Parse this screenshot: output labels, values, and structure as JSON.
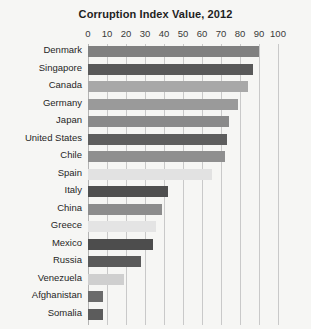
{
  "chart_data": {
    "type": "bar",
    "orientation": "horizontal",
    "title": "Corruption Index Value, 2012",
    "xlabel": "",
    "ylabel": "",
    "xlim": [
      0,
      100
    ],
    "xticks": [
      0,
      10,
      20,
      30,
      40,
      50,
      60,
      70,
      80,
      90,
      100
    ],
    "grid": true,
    "legend": false,
    "categories": [
      "Denmark",
      "Singapore",
      "Canada",
      "Germany",
      "Japan",
      "United States",
      "Chile",
      "Spain",
      "Italy",
      "China",
      "Greece",
      "Mexico",
      "Russia",
      "Venezuela",
      "Afghanistan",
      "Somalia"
    ],
    "values": [
      90,
      87,
      84,
      79,
      74,
      73,
      72,
      65,
      42,
      39,
      36,
      34,
      28,
      19,
      8,
      8
    ],
    "bar_colors": [
      "#808080",
      "#595959",
      "#a8a8a8",
      "#9a9a9a",
      "#8a8a8a",
      "#5e5e5e",
      "#8f8f8f",
      "#e2e2e2",
      "#4f4f4f",
      "#8c8c8c",
      "#e4e4e4",
      "#4d4d4d",
      "#5a5a5a",
      "#cfcfcf",
      "#6b6b6b",
      "#5c5c5c"
    ]
  },
  "colors": {
    "background": "#f6f6f4",
    "gridline": "#c9c9c9",
    "axis": "#b4b4b4",
    "text": "#262626",
    "title": "#1e1e1e"
  }
}
